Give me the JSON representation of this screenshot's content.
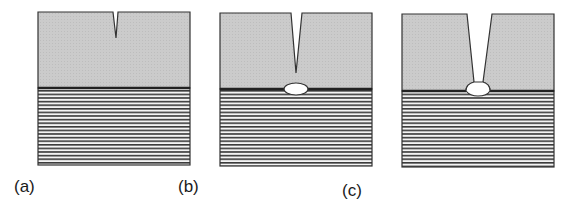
{
  "figure": {
    "colors": {
      "top_layer": "#c9c9c9",
      "substrate_bg": "#f4f4f4",
      "stripe": "#3a3a3a",
      "outline": "#333333",
      "cavity": "#ffffff"
    },
    "panels": [
      {
        "id": "a",
        "label": "(a)",
        "stage": "notch at surface"
      },
      {
        "id": "b",
        "label": "(b)",
        "stage": "crack deepens, void at interface"
      },
      {
        "id": "c",
        "label": "(c)",
        "stage": "crack reaches interface void"
      }
    ]
  }
}
